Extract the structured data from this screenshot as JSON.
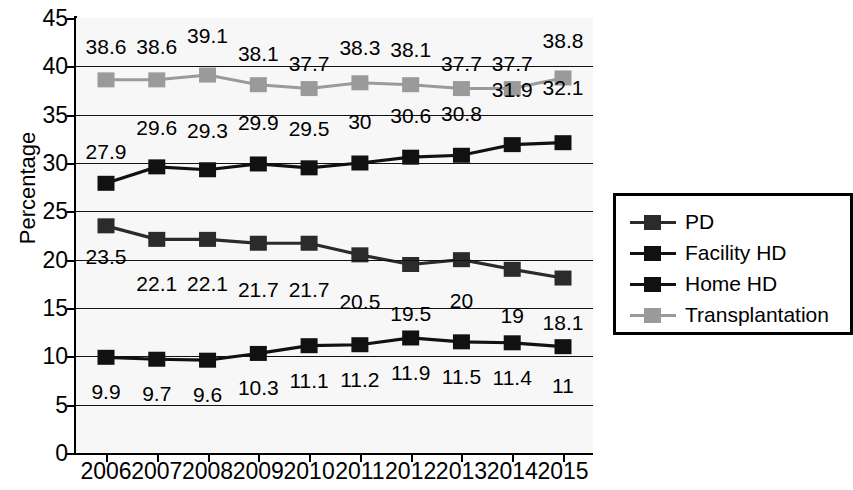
{
  "chart_data": {
    "type": "line",
    "title": "",
    "xlabel": "",
    "ylabel": "Percentage",
    "categories": [
      "2006",
      "2007",
      "2008",
      "2009",
      "2010",
      "2011",
      "2012",
      "2013",
      "2014",
      "2015"
    ],
    "ylim": [
      0,
      45
    ],
    "ytick_step": 5,
    "yticks": [
      "0",
      "5",
      "10",
      "15",
      "20",
      "25",
      "30",
      "35",
      "40",
      "45"
    ],
    "grid": true,
    "grid_axis": "y",
    "legend_position": "right-outside",
    "series": [
      {
        "name": "PD",
        "color": "#2b2b2b",
        "marker": "square",
        "values": [
          23.5,
          22.1,
          22.1,
          21.7,
          21.7,
          20.5,
          19.5,
          20,
          19,
          18.1
        ],
        "labels": [
          "23.5",
          "22.1",
          "22.1",
          "21.7",
          "21.7",
          "20.5",
          "19.5",
          "20",
          "19",
          "18.1"
        ]
      },
      {
        "name": "Facility HD",
        "color": "#111111",
        "marker": "square",
        "values": [
          27.9,
          29.6,
          29.3,
          29.9,
          29.5,
          30,
          30.6,
          30.8,
          31.9,
          32.1
        ],
        "labels": [
          "27.9",
          "29.6",
          "29.3",
          "29.9",
          "29.5",
          "30",
          "30.6",
          "30.8",
          "31.9",
          "32.1"
        ]
      },
      {
        "name": "Home HD",
        "color": "#111111",
        "marker": "square",
        "values": [
          9.9,
          9.7,
          9.6,
          10.3,
          11.1,
          11.2,
          11.9,
          11.5,
          11.4,
          11
        ],
        "labels": [
          "9.9",
          "9.7",
          "9.6",
          "10.3",
          "11.1",
          "11.2",
          "11.9",
          "11.5",
          "11.4",
          "11"
        ]
      },
      {
        "name": "Transplantation",
        "color": "#9a9a9a",
        "marker": "square",
        "values": [
          38.6,
          38.6,
          39.1,
          38.1,
          37.7,
          38.3,
          38.1,
          37.7,
          37.7,
          38.8
        ],
        "labels": [
          "38.6",
          "38.6",
          "39.1",
          "38.1",
          "37.7",
          "38.3",
          "38.1",
          "37.7",
          "37.7",
          "38.8"
        ]
      }
    ]
  },
  "legend": {
    "items": [
      {
        "label": "PD",
        "color": "#2b2b2b"
      },
      {
        "label": "Facility HD",
        "color": "#111111"
      },
      {
        "label": "Home HD",
        "color": "#111111"
      },
      {
        "label": "Transplantation",
        "color": "#9a9a9a"
      }
    ]
  }
}
